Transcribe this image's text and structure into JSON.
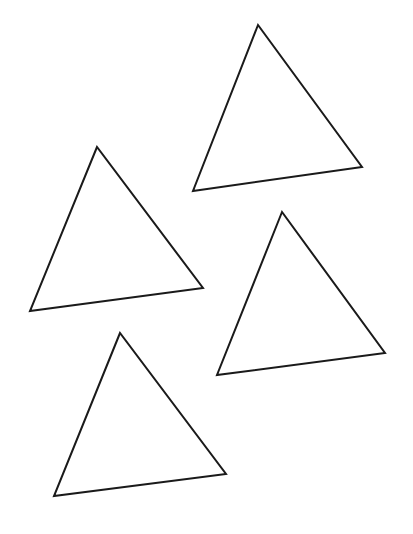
{
  "canvas": {
    "width": 413,
    "height": 534,
    "background": "#ffffff"
  },
  "stroke": {
    "color": "#1a1a1a",
    "width": 2
  },
  "shapes": [
    {
      "type": "triangle",
      "name": "triangle-top-right",
      "points": [
        [
          258,
          25
        ],
        [
          193,
          191
        ],
        [
          362,
          167
        ]
      ]
    },
    {
      "type": "triangle",
      "name": "triangle-mid-left",
      "points": [
        [
          97,
          147
        ],
        [
          30,
          311
        ],
        [
          203,
          288
        ]
      ]
    },
    {
      "type": "triangle",
      "name": "triangle-mid-right",
      "points": [
        [
          282,
          212
        ],
        [
          217,
          375
        ],
        [
          385,
          353
        ]
      ]
    },
    {
      "type": "triangle",
      "name": "triangle-bottom-left",
      "points": [
        [
          120,
          333
        ],
        [
          54,
          496
        ],
        [
          226,
          474
        ]
      ]
    }
  ]
}
